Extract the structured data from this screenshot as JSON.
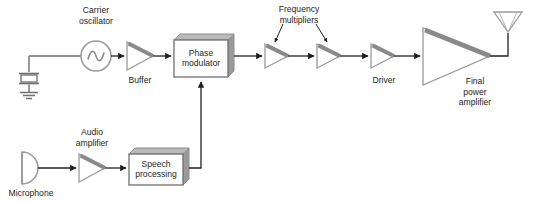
{
  "diagram": {
    "colors": {
      "stroke": "#6f6f6f",
      "line": "#231f20",
      "shadow": "#8a8a8a",
      "box_fill": "#ffffff",
      "box_top_face": "#b9b9b9",
      "box_side_face": "#9a9a9a",
      "text": "#231f20",
      "background": "#ffffff"
    },
    "labels": {
      "carrier_oscillator": [
        "Carrier",
        "oscillator"
      ],
      "buffer": [
        "Buffer"
      ],
      "phase_modulator": [
        "Phase",
        "modulator"
      ],
      "frequency_multipliers": [
        "Frequency",
        "multipliers"
      ],
      "driver": [
        "Driver"
      ],
      "final_power_amplifier": [
        "Final",
        "power",
        "amplifier"
      ],
      "microphone": [
        "Microphone"
      ],
      "audio_amplifier": [
        "Audio",
        "amplifier"
      ],
      "speech_processing": [
        "Speech",
        "processing"
      ]
    },
    "nodes": [
      {
        "id": "crystal",
        "name": "crystal-oscillator-symbol",
        "label": ""
      },
      {
        "id": "ground",
        "name": "ground-symbol",
        "label": ""
      },
      {
        "id": "oscillator",
        "name": "carrier-oscillator-symbol",
        "label": "Carrier oscillator"
      },
      {
        "id": "buffer",
        "name": "buffer-amplifier",
        "label": "Buffer"
      },
      {
        "id": "phase-modulator",
        "name": "phase-modulator-block",
        "label": "Phase modulator"
      },
      {
        "id": "multiplier-1",
        "name": "frequency-multiplier-1",
        "label": "Frequency multipliers"
      },
      {
        "id": "multiplier-2",
        "name": "frequency-multiplier-2",
        "label": "Frequency multipliers"
      },
      {
        "id": "driver",
        "name": "driver-amplifier",
        "label": "Driver"
      },
      {
        "id": "final-amp",
        "name": "final-power-amplifier",
        "label": "Final power amplifier"
      },
      {
        "id": "antenna",
        "name": "antenna-symbol",
        "label": ""
      },
      {
        "id": "microphone",
        "name": "microphone-symbol",
        "label": "Microphone"
      },
      {
        "id": "audio-amp",
        "name": "audio-amplifier",
        "label": "Audio amplifier"
      },
      {
        "id": "speech-proc",
        "name": "speech-processing-block",
        "label": "Speech processing"
      }
    ]
  }
}
